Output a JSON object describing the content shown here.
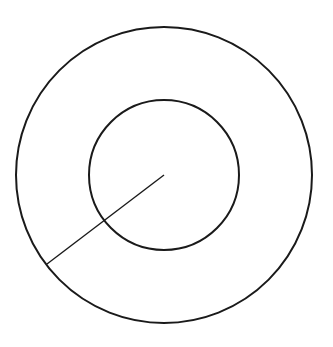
{
  "diagram": {
    "type": "concentric-circles",
    "stroke_color": "#1a1a1a",
    "background": "#ffffff",
    "center": {
      "x": 164,
      "y": 175
    },
    "outer_circle": {
      "r": 148,
      "stroke_width": 2
    },
    "inner_circle": {
      "r": 75,
      "stroke_width": 2
    },
    "radius_line": {
      "x1": 164,
      "y1": 175,
      "x2": 47,
      "y2": 264,
      "stroke_width": 1.4
    }
  }
}
